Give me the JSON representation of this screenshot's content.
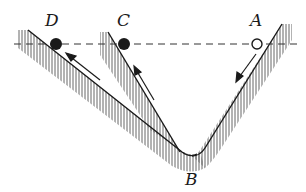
{
  "diagram": {
    "labels": {
      "A": "A",
      "B": "B",
      "C": "C",
      "D": "D"
    },
    "points": {
      "A": {
        "type": "open-circle",
        "x": 257,
        "y": 44
      },
      "C": {
        "type": "filled-circle",
        "x": 124,
        "y": 44
      },
      "D": {
        "type": "filled-circle",
        "x": 56,
        "y": 44
      },
      "B": {
        "type": "valley-bottom",
        "x": 192,
        "y": 156
      }
    },
    "reference_line": {
      "style": "dashed",
      "y": 44
    },
    "arrows": [
      {
        "on": "slope-A",
        "direction": "down-left"
      },
      {
        "on": "slope-C",
        "direction": "up-left"
      },
      {
        "on": "slope-D",
        "direction": "up-left"
      }
    ],
    "colors": {
      "ink": "#1a1a1a",
      "hatch": "#555555"
    }
  }
}
